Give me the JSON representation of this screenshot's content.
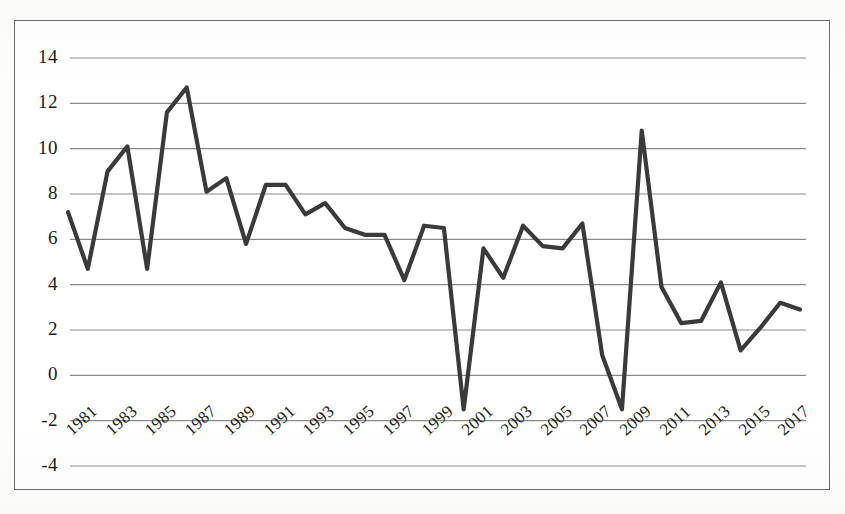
{
  "chart_data": {
    "type": "line",
    "title": "",
    "subtitle": "",
    "xlabel": "",
    "ylabel": "",
    "grid": true,
    "legend": false,
    "legend_position": "none",
    "line_color": "#3a3a3a",
    "grid_color": "#8a8a8a",
    "axis_color": "#6b6b6b",
    "ylim": [
      -4,
      14
    ],
    "ytick_labels": [
      "14",
      "12",
      "10",
      "8",
      "6",
      "4",
      "2",
      "0",
      "-2",
      "-4"
    ],
    "ytick_values": [
      14,
      12,
      10,
      8,
      6,
      4,
      2,
      0,
      -2,
      -4
    ],
    "xtick_labels": [
      "1981",
      "1983",
      "1985",
      "1987",
      "1989",
      "1991",
      "1993",
      "1995",
      "1997",
      "1999",
      "2001",
      "2003",
      "2005",
      "2007",
      "2009",
      "2011",
      "2013",
      "2015",
      "2017"
    ],
    "xtick_values": [
      1981,
      1983,
      1985,
      1987,
      1989,
      1991,
      1993,
      1995,
      1997,
      1999,
      2001,
      2003,
      2005,
      2007,
      2009,
      2011,
      2013,
      2015,
      2017
    ],
    "x": [
      1981,
      1982,
      1983,
      1984,
      1985,
      1986,
      1987,
      1988,
      1989,
      1990,
      1991,
      1992,
      1993,
      1994,
      1995,
      1996,
      1997,
      1998,
      1999,
      2000,
      2001,
      2002,
      2003,
      2004,
      2005,
      2006,
      2007,
      2008,
      2009,
      2010,
      2011,
      2012,
      2013,
      2014,
      2015,
      2016,
      2017,
      2018
    ],
    "values": [
      7.2,
      4.7,
      9.0,
      10.1,
      4.7,
      11.6,
      12.7,
      8.1,
      8.7,
      5.8,
      8.4,
      8.4,
      7.1,
      7.6,
      6.5,
      6.2,
      6.2,
      4.2,
      6.6,
      6.5,
      -1.5,
      5.6,
      4.3,
      6.6,
      5.7,
      5.6,
      6.7,
      0.9,
      -1.5,
      10.8,
      3.9,
      2.3,
      2.4,
      4.1,
      1.1,
      2.1,
      3.2,
      2.9
    ],
    "series": [
      {
        "name": "series-1",
        "values": [
          7.2,
          4.7,
          9.0,
          10.1,
          4.7,
          11.6,
          12.7,
          8.1,
          8.7,
          5.8,
          8.4,
          8.4,
          7.1,
          7.6,
          6.5,
          6.2,
          6.2,
          4.2,
          6.6,
          6.5,
          -1.5,
          5.6,
          4.3,
          6.6,
          5.7,
          5.6,
          6.7,
          0.9,
          -1.5,
          10.8,
          3.9,
          2.3,
          2.4,
          4.1,
          1.1,
          2.1,
          3.2,
          2.9
        ]
      }
    ]
  }
}
